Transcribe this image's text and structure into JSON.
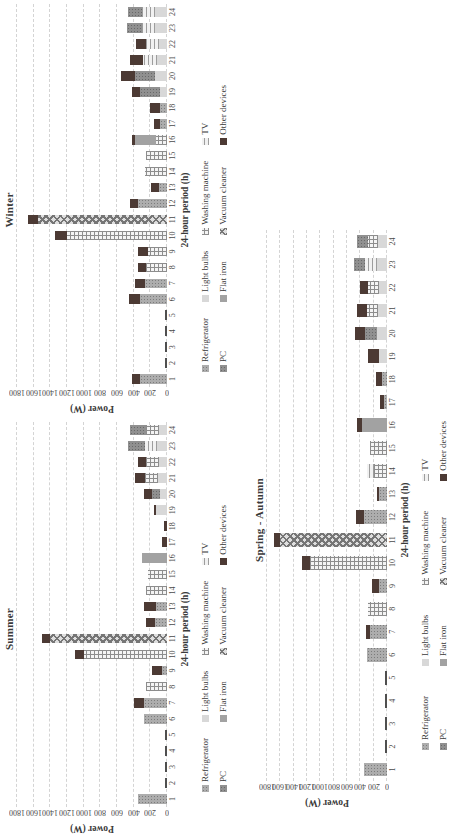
{
  "figure": {
    "background": "#ffffff",
    "ink_color": "#3a3a3a",
    "gridline_color": "#d4d4d4",
    "zero_dash_color": "#4f4f4f",
    "orientation": "rotated-90-ccw"
  },
  "legend": {
    "items": [
      {
        "key": "refrigerator",
        "label": "Refrigerator",
        "color": "#adadad",
        "pattern": "dots"
      },
      {
        "key": "light_bulbs",
        "label": "Light bulbs",
        "color": "#d8d8d8",
        "pattern": "solid"
      },
      {
        "key": "washing_machine",
        "label": "Washing machine",
        "color": "#8d8d8d",
        "pattern": "grid"
      },
      {
        "key": "tv",
        "label": "TV",
        "color": "#9d9d9d",
        "pattern": "hlines"
      },
      {
        "key": "pc",
        "label": "PC",
        "color": "#909090",
        "pattern": "dots"
      },
      {
        "key": "flat_iron",
        "label": "Flat iron",
        "color": "#a2a2a2",
        "pattern": "dense-dots"
      },
      {
        "key": "vacuum_cleaner",
        "label": "Vacuum cleaner",
        "color": "#767676",
        "pattern": "checker"
      },
      {
        "key": "other_devices",
        "label": "Other devices",
        "color": "#4c3a34",
        "pattern": "solid"
      }
    ]
  },
  "chart_data": [
    {
      "id": "summer",
      "type": "bar",
      "stacked": true,
      "title": "Summer",
      "xlabel": "24-hour period (h)",
      "ylabel": "Power (W)",
      "ylim": [
        0,
        1800
      ],
      "ytick_step": 200,
      "grid": "dashed-horizontal",
      "legend_position": "bottom",
      "categories": [
        1,
        2,
        3,
        4,
        5,
        6,
        7,
        8,
        9,
        10,
        11,
        12,
        13,
        14,
        15,
        16,
        17,
        18,
        19,
        20,
        21,
        22,
        23,
        24
      ],
      "series": [
        {
          "name": "Refrigerator",
          "key": "refrigerator",
          "values": [
            350,
            0,
            0,
            0,
            0,
            280,
            280,
            0,
            60,
            0,
            0,
            150,
            130,
            0,
            0,
            0,
            0,
            0,
            0,
            0,
            0,
            0,
            0,
            0
          ]
        },
        {
          "name": "Light bulbs",
          "key": "light_bulbs",
          "values": [
            0,
            0,
            0,
            0,
            0,
            0,
            0,
            0,
            0,
            0,
            0,
            0,
            0,
            0,
            0,
            0,
            0,
            0,
            130,
            80,
            110,
            100,
            120,
            100
          ]
        },
        {
          "name": "Washing machine",
          "key": "washing_machine",
          "values": [
            0,
            0,
            0,
            0,
            0,
            0,
            0,
            250,
            0,
            1000,
            0,
            0,
            0,
            250,
            230,
            0,
            0,
            0,
            0,
            0,
            150,
            150,
            0,
            150
          ]
        },
        {
          "name": "TV",
          "key": "tv",
          "values": [
            0,
            0,
            0,
            0,
            0,
            0,
            0,
            0,
            0,
            0,
            0,
            0,
            0,
            0,
            0,
            0,
            0,
            0,
            0,
            0,
            0,
            0,
            150,
            0
          ]
        },
        {
          "name": "PC",
          "key": "pc",
          "values": [
            0,
            0,
            0,
            0,
            0,
            0,
            0,
            0,
            0,
            0,
            0,
            0,
            0,
            0,
            0,
            0,
            0,
            0,
            0,
            100,
            0,
            0,
            200,
            200
          ]
        },
        {
          "name": "Flat iron",
          "key": "flat_iron",
          "values": [
            0,
            0,
            0,
            0,
            0,
            0,
            0,
            0,
            0,
            0,
            0,
            0,
            0,
            0,
            0,
            300,
            0,
            0,
            0,
            0,
            0,
            0,
            0,
            0
          ]
        },
        {
          "name": "Vacuum cleaner",
          "key": "vacuum_cleaner",
          "values": [
            0,
            0,
            0,
            0,
            0,
            0,
            0,
            0,
            0,
            0,
            1400,
            0,
            0,
            0,
            0,
            0,
            0,
            0,
            0,
            0,
            0,
            0,
            0,
            0
          ]
        },
        {
          "name": "Other devices",
          "key": "other_devices",
          "values": [
            0,
            0,
            0,
            0,
            0,
            0,
            120,
            0,
            120,
            100,
            100,
            100,
            150,
            0,
            0,
            0,
            60,
            40,
            30,
            100,
            120,
            100,
            0,
            0
          ]
        }
      ]
    },
    {
      "id": "winter",
      "type": "bar",
      "stacked": true,
      "title": "Winter",
      "xlabel": "24-hour period (h)",
      "ylabel": "Power (W)",
      "ylim": [
        0,
        1800
      ],
      "ytick_step": 200,
      "grid": "dashed-horizontal",
      "legend_position": "bottom",
      "categories": [
        1,
        2,
        3,
        4,
        5,
        6,
        7,
        8,
        9,
        10,
        11,
        12,
        13,
        14,
        15,
        16,
        17,
        18,
        19,
        20,
        21,
        22,
        23,
        24
      ],
      "series": [
        {
          "name": "Refrigerator",
          "key": "refrigerator",
          "values": [
            320,
            0,
            0,
            0,
            0,
            320,
            260,
            0,
            0,
            0,
            0,
            350,
            100,
            0,
            0,
            0,
            80,
            90,
            0,
            0,
            0,
            0,
            0,
            0
          ]
        },
        {
          "name": "Light bulbs",
          "key": "light_bulbs",
          "values": [
            0,
            0,
            0,
            0,
            0,
            0,
            0,
            0,
            0,
            0,
            0,
            0,
            0,
            0,
            0,
            0,
            0,
            0,
            90,
            150,
            120,
            100,
            140,
            140
          ]
        },
        {
          "name": "Washing machine",
          "key": "washing_machine",
          "values": [
            0,
            0,
            0,
            0,
            0,
            0,
            0,
            250,
            230,
            1200,
            0,
            0,
            0,
            270,
            250,
            130,
            0,
            0,
            0,
            0,
            0,
            0,
            0,
            0
          ]
        },
        {
          "name": "TV",
          "key": "tv",
          "values": [
            0,
            0,
            0,
            0,
            0,
            0,
            0,
            0,
            0,
            0,
            0,
            0,
            0,
            0,
            0,
            0,
            0,
            0,
            0,
            0,
            170,
            150,
            160,
            160
          ]
        },
        {
          "name": "PC",
          "key": "pc",
          "values": [
            0,
            0,
            0,
            0,
            0,
            0,
            0,
            0,
            0,
            0,
            0,
            0,
            0,
            0,
            0,
            0,
            0,
            0,
            230,
            230,
            0,
            0,
            180,
            170
          ]
        },
        {
          "name": "Flat iron",
          "key": "flat_iron",
          "values": [
            0,
            0,
            0,
            0,
            0,
            0,
            0,
            0,
            0,
            0,
            0,
            0,
            0,
            0,
            0,
            250,
            0,
            0,
            0,
            0,
            0,
            0,
            0,
            0
          ]
        },
        {
          "name": "Vacuum cleaner",
          "key": "vacuum_cleaner",
          "values": [
            0,
            0,
            0,
            0,
            0,
            0,
            0,
            0,
            0,
            0,
            1550,
            0,
            0,
            0,
            0,
            0,
            0,
            0,
            0,
            0,
            0,
            0,
            0,
            0
          ]
        },
        {
          "name": "Other devices",
          "key": "other_devices",
          "values": [
            100,
            0,
            0,
            0,
            0,
            140,
            120,
            100,
            120,
            150,
            120,
            90,
            90,
            0,
            0,
            40,
            80,
            110,
            100,
            170,
            160,
            120,
            0,
            0
          ]
        }
      ]
    },
    {
      "id": "spring",
      "type": "bar",
      "stacked": true,
      "title": "Spring - Autumn",
      "xlabel": "24-hour period (h)",
      "ylabel": "Power (W)",
      "ylim": [
        0,
        1800
      ],
      "ytick_step": 200,
      "grid": "dashed-horizontal",
      "legend_position": "bottom",
      "categories": [
        1,
        2,
        3,
        4,
        5,
        6,
        7,
        8,
        9,
        10,
        11,
        12,
        13,
        14,
        15,
        16,
        17,
        18,
        19,
        20,
        21,
        22,
        23,
        24
      ],
      "series": [
        {
          "name": "Refrigerator",
          "key": "refrigerator",
          "values": [
            350,
            0,
            0,
            0,
            0,
            300,
            250,
            0,
            120,
            0,
            0,
            350,
            120,
            0,
            0,
            0,
            40,
            80,
            0,
            0,
            0,
            0,
            0,
            0
          ]
        },
        {
          "name": "Light bulbs",
          "key": "light_bulbs",
          "values": [
            0,
            0,
            0,
            0,
            0,
            0,
            0,
            0,
            0,
            0,
            0,
            0,
            0,
            0,
            0,
            0,
            0,
            0,
            120,
            150,
            140,
            120,
            150,
            140
          ]
        },
        {
          "name": "Washing machine",
          "key": "washing_machine",
          "values": [
            0,
            0,
            0,
            0,
            0,
            0,
            0,
            280,
            0,
            1150,
            0,
            0,
            0,
            200,
            250,
            0,
            0,
            0,
            0,
            0,
            160,
            160,
            0,
            150
          ]
        },
        {
          "name": "TV",
          "key": "tv",
          "values": [
            0,
            0,
            0,
            0,
            0,
            0,
            0,
            0,
            0,
            0,
            0,
            0,
            0,
            100,
            0,
            0,
            0,
            0,
            0,
            0,
            0,
            0,
            180,
            0
          ]
        },
        {
          "name": "PC",
          "key": "pc",
          "values": [
            0,
            0,
            0,
            0,
            0,
            0,
            0,
            0,
            0,
            0,
            0,
            0,
            0,
            0,
            0,
            0,
            0,
            0,
            0,
            180,
            0,
            0,
            170,
            160
          ]
        },
        {
          "name": "Flat iron",
          "key": "flat_iron",
          "values": [
            0,
            0,
            0,
            0,
            0,
            0,
            0,
            0,
            0,
            0,
            0,
            0,
            0,
            0,
            0,
            380,
            0,
            0,
            0,
            0,
            0,
            0,
            0,
            0
          ]
        },
        {
          "name": "Vacuum cleaner",
          "key": "vacuum_cleaner",
          "values": [
            0,
            0,
            0,
            0,
            0,
            0,
            0,
            0,
            0,
            0,
            1600,
            0,
            0,
            0,
            0,
            0,
            0,
            0,
            0,
            0,
            0,
            0,
            0,
            0
          ]
        },
        {
          "name": "Other devices",
          "key": "other_devices",
          "values": [
            0,
            0,
            0,
            0,
            0,
            0,
            70,
            0,
            100,
            130,
            100,
            120,
            30,
            0,
            0,
            70,
            60,
            80,
            160,
            150,
            150,
            120,
            0,
            0
          ]
        }
      ]
    }
  ]
}
